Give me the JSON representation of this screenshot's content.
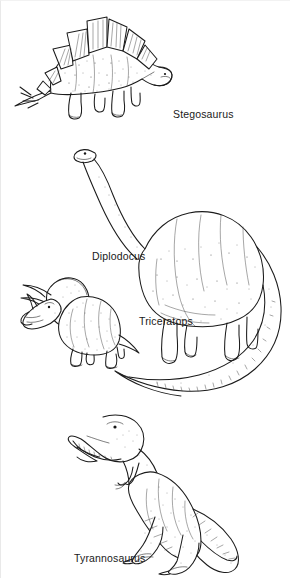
{
  "page": {
    "background_color": "#ffffff",
    "ink_color": "#1b1b1b",
    "width": 290,
    "height": 578,
    "style": "black-and-white stippled line drawing"
  },
  "figures": [
    {
      "id": "stegosaurus",
      "label": "Stegosaurus",
      "label_position": "right-of-figure",
      "description": "Quadrupedal dinosaur in left profile with double row of large triangular dorsal plates and spiked tail, head lowered to the right",
      "facing": "right"
    },
    {
      "id": "diplodocus",
      "label": "Diplodocus",
      "label_position": "left-of-figure",
      "description": "Large quadrupedal sauropod in left profile with long upward-curving neck, small head, barrel body and extremely long tapering tail sweeping down and to the left",
      "facing": "left"
    },
    {
      "id": "triceratops",
      "label": "Triceratops",
      "label_position": "right-of-figure",
      "description": "Quadrupedal horned dinosaur in left profile with bony neck frill, two long brow horns and one nose horn, short tail",
      "facing": "left"
    },
    {
      "id": "tyrannosaurus",
      "label": "Tyrannosaurus",
      "label_position": "below-left-of-figure",
      "description": "Bipedal theropod in left profile standing upright with massive toothed jaws, tiny two-fingered forelimbs, powerful hind legs and long counterbalancing tail",
      "facing": "left"
    }
  ],
  "captions": {
    "stegosaurus": "Stegosaurus",
    "diplodocus": "Diplodocus",
    "triceratops": "Triceratops",
    "tyrannosaurus": "Tyrannosaurus"
  }
}
